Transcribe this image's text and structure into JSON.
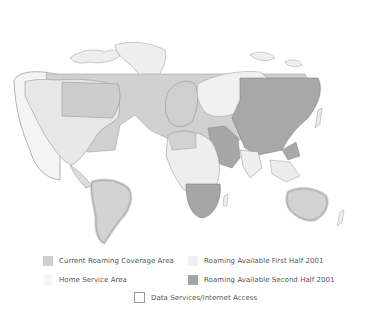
{
  "map": {
    "title": "",
    "colors": {
      "current_roaming": "#cfcfcf",
      "home_service": "#f3f3f3",
      "first_half_2001": "#efefef",
      "second_half_2001": "#a9a9a9",
      "land_other": "#ececec",
      "border": "#8a8a8a",
      "outline": "#9a9a9a"
    }
  },
  "legend": {
    "items": [
      {
        "label": "Current Roaming Coverage Area",
        "swatch": "#cfcfcf"
      },
      {
        "label": "Roaming Available First Half 2001",
        "swatch": "#f0f0f0"
      },
      {
        "label": "Home Service Area",
        "swatch": "#f5f5f5"
      },
      {
        "label": "Roaming Available Second Half 2001",
        "swatch": "#a5a5a5"
      },
      {
        "label": "Data Services/Internet Access",
        "swatch": "outline"
      }
    ]
  }
}
